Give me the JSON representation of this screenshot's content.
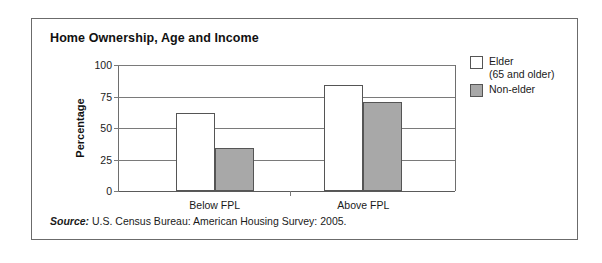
{
  "figure": {
    "title": "Home Ownership, Age and Income",
    "source_label": "Source:",
    "source_text": "U.S. Census Bureau: American Housing Survey: 2005."
  },
  "colors": {
    "elder_fill": "#ffffff",
    "nonelder_fill": "#a8a8a8",
    "bar_stroke": "#555555",
    "gridline": "#7a7a7a",
    "frame": "#6b6b6b"
  },
  "legend": {
    "position": "right",
    "entries": [
      {
        "label_line1": "Elder",
        "label_line2": "(65 and older)",
        "swatch": "elder"
      },
      {
        "label_line1": "Non-elder",
        "label_line2": "",
        "swatch": "nonelder"
      }
    ]
  },
  "chart_data": {
    "type": "bar",
    "title": "Home Ownership, Age and Income",
    "xlabel": "",
    "ylabel": "Percentage",
    "categories": [
      "Below FPL",
      "Above FPL"
    ],
    "series": [
      {
        "name": "Elder (65 and older)",
        "values": [
          62,
          84
        ]
      },
      {
        "name": "Non-elder",
        "values": [
          34,
          71
        ]
      }
    ],
    "ylim": [
      0,
      100
    ],
    "yticks": [
      0,
      25,
      50,
      75,
      100
    ],
    "ytick_labels": [
      "0",
      "25",
      "50",
      "75",
      "100"
    ],
    "grid": true,
    "legend_position": "right",
    "source": "U.S. Census Bureau: American Housing Survey: 2005."
  }
}
